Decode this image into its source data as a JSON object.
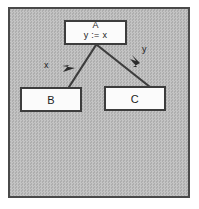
{
  "diagram": {
    "background_color": "#b9b9b9",
    "frame_color": "#4a4a4a",
    "node_fill": "#fbfbfb",
    "node_border": "#3d3d3d",
    "edge_color": "#3d3d3d",
    "nodes": [
      {
        "id": "A",
        "label": "A",
        "statement": "y := x"
      },
      {
        "id": "B",
        "label": "B",
        "statement": ""
      },
      {
        "id": "C",
        "label": "C",
        "statement": ""
      }
    ],
    "edges": [
      {
        "from": "A",
        "to": "B",
        "label": "x",
        "direction": "B-to-A"
      },
      {
        "from": "A",
        "to": "C",
        "label": "y",
        "direction": "A-to-C"
      }
    ]
  }
}
